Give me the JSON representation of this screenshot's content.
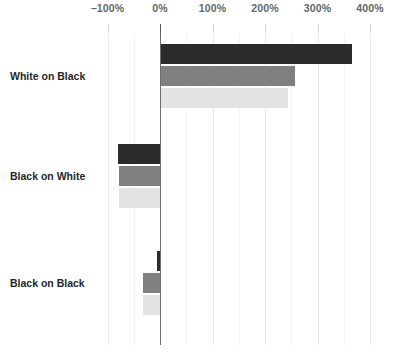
{
  "chart_data": {
    "type": "bar",
    "orientation": "horizontal",
    "title": "",
    "xlabel": "",
    "ylabel": "",
    "categories": [
      "White on Black",
      "Black on White",
      "Black on Black"
    ],
    "series": [
      {
        "name": "series-1-dark",
        "color": "#2b2b2b",
        "values": [
          365,
          -80,
          -6
        ]
      },
      {
        "name": "series-2-gray",
        "color": "#808080",
        "values": [
          257,
          -78,
          -32
        ]
      },
      {
        "name": "series-3-light",
        "color": "#e3e3e3",
        "values": [
          244,
          -78,
          -33
        ]
      }
    ],
    "xlim": [
      -130,
      420
    ],
    "xticks": [
      -100,
      0,
      100,
      200,
      300,
      400
    ],
    "xticklabels": [
      "–100%",
      "0%",
      "100%",
      "200%",
      "300%",
      "400%"
    ],
    "minor_xticks": [
      -50,
      50,
      150,
      250,
      350
    ],
    "grid": true,
    "zero_line": true,
    "legend": "none",
    "background": "#ffffff",
    "axis_label_color": "#62666a",
    "category_label_color": "#22262a",
    "gridline_color": "#ebebeb",
    "zero_line_color": "#6e6e6e"
  }
}
